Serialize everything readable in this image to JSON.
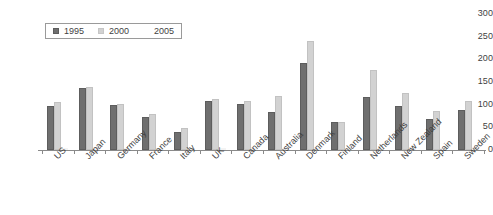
{
  "chart_data": {
    "type": "bar",
    "title": "",
    "subtitle": "",
    "xlabel": "",
    "ylabel": "",
    "ylim": [
      0,
      300
    ],
    "ytick_step": 50,
    "ytick_labels": [
      "0",
      "50",
      "100",
      "150",
      "200",
      "250",
      "300"
    ],
    "grid": false,
    "legend_position": "top-left",
    "legend_bordered": true,
    "xtick_rotation": -45,
    "categories": [
      "US",
      "Japan",
      "Germany",
      "France",
      "Italy",
      "UK",
      "Canada",
      "Australia",
      "Denmark",
      "Finland",
      "Netherlands",
      "New Zealand",
      "Spain",
      "Sweden"
    ],
    "series": [
      {
        "name": "1995",
        "color": "#6f6f6f",
        "values": [
          98,
          137,
          100,
          72,
          40,
          108,
          102,
          83,
          192,
          62,
          118,
          98,
          68,
          88
        ]
      },
      {
        "name": "2000",
        "color": "#d2d2d2",
        "values": [
          105,
          139,
          101,
          80,
          48,
          113,
          108,
          120,
          240,
          62,
          177,
          125,
          85,
          108
        ]
      },
      {
        "name": "2005",
        "color": "#fdfdfd",
        "values": [
          0,
          0,
          0,
          0,
          0,
          0,
          0,
          0,
          0,
          0,
          0,
          0,
          0,
          0
        ]
      }
    ]
  },
  "legend": {
    "entries": [
      {
        "label": "1995",
        "swatch": "legend-swatch-1995"
      },
      {
        "label": "2000",
        "swatch": "legend-swatch-2000"
      },
      {
        "label": "2005",
        "swatch": "legend-swatch-2005"
      }
    ]
  }
}
